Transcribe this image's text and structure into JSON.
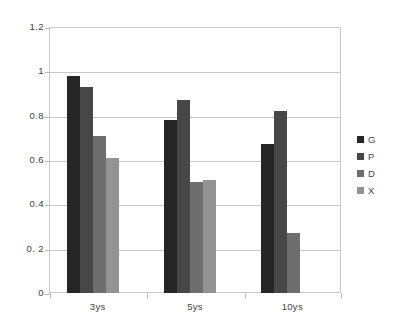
{
  "chart_data": {
    "type": "bar",
    "title": "",
    "subtitle": "",
    "xlabel": "",
    "ylabel": "",
    "categories": [
      "3ys",
      "5ys",
      "10ys"
    ],
    "series": [
      {
        "name": "G",
        "values": [
          0.98,
          0.78,
          0.67
        ],
        "color": "#262626"
      },
      {
        "name": "P",
        "values": [
          0.93,
          0.87,
          0.82
        ],
        "color": "#474747"
      },
      {
        "name": "D",
        "values": [
          0.71,
          0.5,
          0.27
        ],
        "color": "#6e6e6e"
      },
      {
        "name": "X",
        "values": [
          0.61,
          0.51,
          null
        ],
        "color": "#939393"
      }
    ],
    "ylim": [
      0,
      1.2
    ],
    "ytick_step": 0.2,
    "ytick_labels": [
      "1.2",
      "1",
      "0.8",
      "0.6",
      "0.4",
      "0. 2",
      "0"
    ],
    "ytick_values": [
      1.2,
      1.0,
      0.8,
      0.6,
      0.4,
      0.2,
      0
    ],
    "grid": true,
    "grid_axis": "y",
    "legend_position": "right",
    "legend_entries": [
      "G",
      "P",
      "D",
      "X"
    ],
    "plot_background": "#ffffff",
    "frame_color": "#c9c9c9",
    "gridline_color": "#c9c9c9",
    "text_color": "#3f3f3f",
    "annotations": []
  }
}
